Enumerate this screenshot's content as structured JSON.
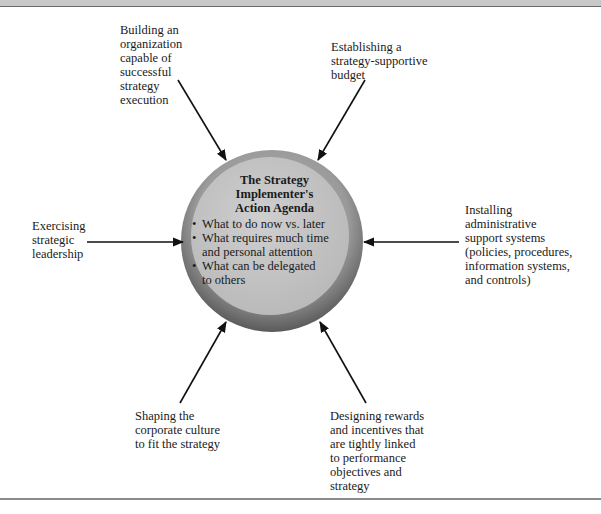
{
  "diagram": {
    "center": {
      "title": "The Strategy\nImplementer's\nAction Agenda",
      "bullets": [
        "What to do now vs. later",
        "What requires much time\nand personal attention",
        "What can be delegated\nto others"
      ]
    },
    "nodes": {
      "top_left": "Building an\norganization\ncapable of\nsuccessful\nstrategy\nexecution",
      "top_right": "Establishing a\nstrategy-supportive\nbudget",
      "left": "Exercising\nstrategic\nleadership",
      "right": "Installing\nadministrative\nsupport systems\n(policies, procedures,\ninformation systems,\nand controls)",
      "bottom_left": "Shaping the\ncorporate culture\nto fit the strategy",
      "bottom_right": "Designing rewards\nand incentives that\nare tightly linked\nto performance\nobjectives and\nstrategy"
    },
    "colors": {
      "circle_outer": "#8f8f8f",
      "circle_inner": "#c4c4c4",
      "arrow": "#111111"
    }
  }
}
